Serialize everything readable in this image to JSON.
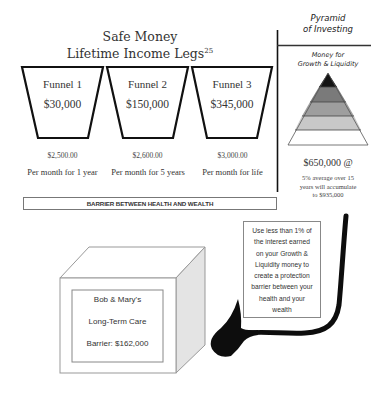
{
  "header": {
    "title_line1": "Safe Money",
    "title_line2": "Lifetime Income Legs",
    "title_superscript": "25"
  },
  "funnels": [
    {
      "label": "Funnel 1",
      "amount": "$30,000",
      "monthly": "$2,500.00",
      "duration": "Per month for 1 year"
    },
    {
      "label": "Funnel 2",
      "amount": "$150,000",
      "monthly": "$2,600.00",
      "duration": "Per month for 5 years"
    },
    {
      "label": "Funnel 3",
      "amount": "$345,000",
      "monthly": "$3,000.00",
      "duration": "Per month for life"
    }
  ],
  "barrier_label": "BARRIER BETWEEN HEALTH AND WEALTH",
  "pyramid": {
    "title_line1": "Pyramid",
    "title_line2": "of Investing",
    "subtitle_line1": "Money for",
    "subtitle_line2": "Growth & Liquidity",
    "amount": "$650,000 @",
    "note_lines": [
      "5% average over 15",
      "years will accumulate",
      "to $935,000"
    ],
    "layer_colors": [
      "#141414",
      "#7a7a7a",
      "#9e9e9e",
      "#c8c8c8",
      "#ffffff"
    ]
  },
  "callout": {
    "lines": [
      "Use less than 1% of",
      "the interest earned",
      "on your Growth &",
      "Liquidity money to",
      "create a protection",
      "barrier between your",
      "health and your",
      "wealth"
    ]
  },
  "cube": {
    "line1": "Bob & Mary's",
    "line2": "Long-Term Care",
    "line3": "Barrier: $162,000",
    "side_color": "#e4e4e4"
  }
}
